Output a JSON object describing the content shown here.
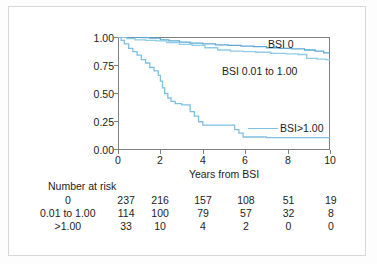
{
  "chart_data": {
    "type": "line",
    "title": "",
    "xlabel": "Years from BSI",
    "ylabel": "",
    "xlim": [
      0,
      10
    ],
    "ylim": [
      0,
      1
    ],
    "xticks": [
      "0",
      "2",
      "4",
      "6",
      "8",
      "10"
    ],
    "yticks": [
      "1.00",
      "0.75",
      "0.50",
      "0.25",
      "0.00"
    ],
    "grid": false,
    "legend_position": "inline-annotations",
    "colors": {
      "bsi_0": "#5ba9d4",
      "bsi_mid": "#8ecbe6",
      "bsi_high": "#7fc0e0",
      "axis": "#808080",
      "text": "#1c1c1c",
      "frame": "#d8d8d8"
    },
    "annotations": [
      {
        "text": "BSI 0",
        "x": 8.0,
        "y": 0.97
      },
      {
        "text": "BSI 0.01 to 1.00",
        "x": 5.5,
        "y": 0.72
      },
      {
        "text": "BSI>1.00",
        "x": 8.4,
        "y": 0.12
      }
    ],
    "series": [
      {
        "name": "BSI 0",
        "color": "#5ba9d4",
        "points": [
          [
            0.0,
            1.0
          ],
          [
            0.9,
            1.0
          ],
          [
            1.1,
            0.995
          ],
          [
            1.5,
            0.99
          ],
          [
            2.0,
            0.975
          ],
          [
            2.4,
            0.965
          ],
          [
            2.9,
            0.955
          ],
          [
            3.4,
            0.945
          ],
          [
            4.0,
            0.94
          ],
          [
            4.6,
            0.93
          ],
          [
            5.2,
            0.925
          ],
          [
            5.8,
            0.92
          ],
          [
            6.4,
            0.915
          ],
          [
            7.0,
            0.905
          ],
          [
            7.6,
            0.9
          ],
          [
            8.2,
            0.895
          ],
          [
            8.8,
            0.885
          ],
          [
            9.3,
            0.875
          ],
          [
            9.7,
            0.86
          ],
          [
            10.0,
            0.855
          ]
        ]
      },
      {
        "name": "BSI 0.01 to 1.00",
        "color": "#8ecbe6",
        "points": [
          [
            0.0,
            1.0
          ],
          [
            0.4,
            0.985
          ],
          [
            0.8,
            0.975
          ],
          [
            1.3,
            0.97
          ],
          [
            1.8,
            0.965
          ],
          [
            2.3,
            0.95
          ],
          [
            2.9,
            0.935
          ],
          [
            3.5,
            0.925
          ],
          [
            4.1,
            0.905
          ],
          [
            4.7,
            0.885
          ],
          [
            5.3,
            0.875
          ],
          [
            5.9,
            0.87
          ],
          [
            6.5,
            0.865
          ],
          [
            7.2,
            0.855
          ],
          [
            7.9,
            0.85
          ],
          [
            8.5,
            0.845
          ],
          [
            8.9,
            0.81
          ],
          [
            9.4,
            0.805
          ],
          [
            9.8,
            0.8
          ],
          [
            10.0,
            0.8
          ]
        ]
      },
      {
        "name": "BSI>1.00",
        "color": "#7fc0e0",
        "points": [
          [
            0.0,
            1.0
          ],
          [
            0.15,
            0.97
          ],
          [
            0.3,
            0.94
          ],
          [
            0.5,
            0.9
          ],
          [
            0.7,
            0.87
          ],
          [
            0.9,
            0.84
          ],
          [
            1.1,
            0.8
          ],
          [
            1.3,
            0.77
          ],
          [
            1.5,
            0.73
          ],
          [
            1.7,
            0.7
          ],
          [
            1.9,
            0.66
          ],
          [
            2.0,
            0.61
          ],
          [
            2.1,
            0.55
          ],
          [
            2.2,
            0.5
          ],
          [
            2.35,
            0.46
          ],
          [
            2.5,
            0.43
          ],
          [
            2.7,
            0.41
          ],
          [
            3.0,
            0.4
          ],
          [
            3.2,
            0.4
          ],
          [
            3.4,
            0.34
          ],
          [
            3.6,
            0.3
          ],
          [
            3.8,
            0.25
          ],
          [
            4.0,
            0.22
          ],
          [
            4.6,
            0.22
          ],
          [
            5.2,
            0.22
          ],
          [
            5.5,
            0.18
          ],
          [
            5.7,
            0.15
          ],
          [
            5.9,
            0.115
          ],
          [
            7.0,
            0.11
          ],
          [
            8.5,
            0.11
          ],
          [
            10.0,
            0.11
          ]
        ]
      }
    ]
  },
  "risk_table": {
    "title": "Number at risk",
    "time_points": [
      "0",
      "2",
      "4",
      "6",
      "8",
      "10"
    ],
    "rows": [
      {
        "label": "0",
        "values": [
          "237",
          "216",
          "157",
          "108",
          "51",
          "19"
        ]
      },
      {
        "label": "0.01 to 1.00",
        "values": [
          "114",
          "100",
          "79",
          "57",
          "32",
          "8"
        ]
      },
      {
        "label": ">1.00",
        "values": [
          "33",
          "10",
          "4",
          "2",
          "0",
          "0"
        ]
      }
    ]
  }
}
